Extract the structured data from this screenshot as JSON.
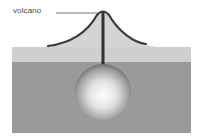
{
  "diagram": {
    "labels": {
      "volcano": "volcano"
    },
    "parts": [
      "volcano cone",
      "conduit",
      "crust layer",
      "mantle layer",
      "magma chamber"
    ],
    "colors": {
      "crust": "#cfcfcf",
      "mantle": "#9a9a9a",
      "cone_fill": "#d8d8d8",
      "cone_outline": "#3a3a3a",
      "conduit": "#333333",
      "leader_line": "#555555",
      "chamber_highlight": "#ffffff",
      "chamber_shadow": "#6e6e6e"
    }
  }
}
